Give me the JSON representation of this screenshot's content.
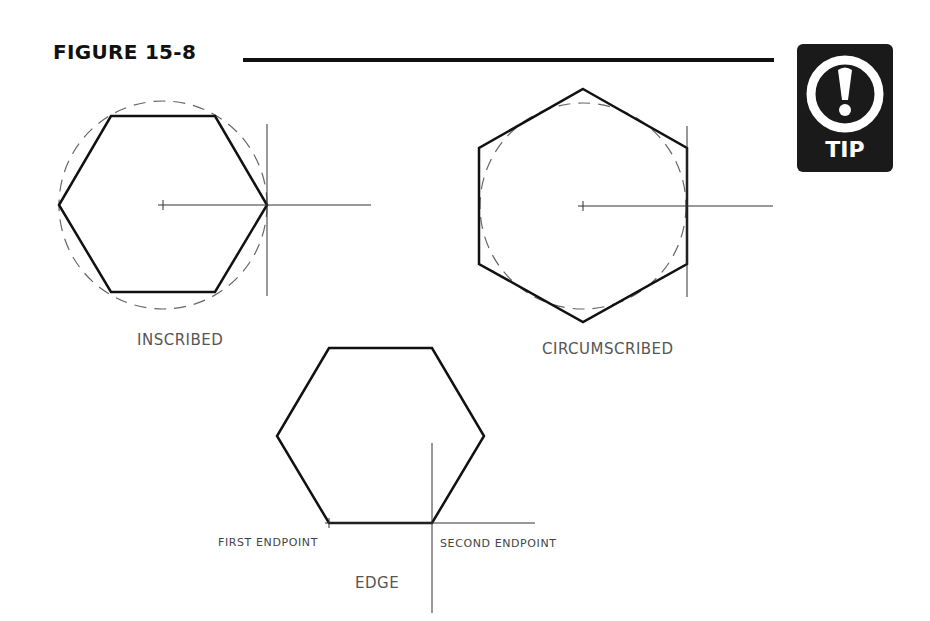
{
  "figure": {
    "title": "FIGURE 15-8",
    "tip_badge": {
      "label": "TIP",
      "icon": "exclamation-circle-icon"
    }
  },
  "diagrams": {
    "inscribed": {
      "label": "INSCRIBED"
    },
    "circumscribed": {
      "label": "CIRCUMSCRIBED"
    },
    "edge": {
      "label": "EDGE",
      "first_endpoint": "FIRST ENDPOINT",
      "second_endpoint": "SECOND ENDPOINT"
    }
  }
}
